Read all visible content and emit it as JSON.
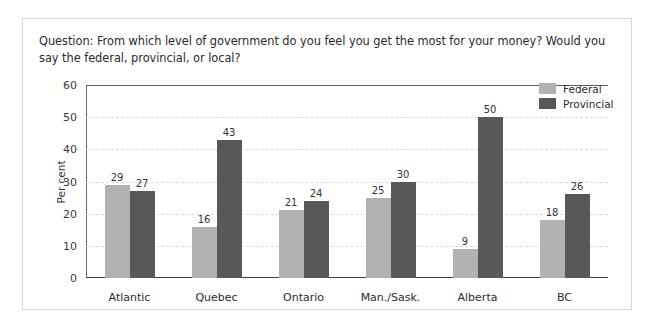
{
  "question": "Question: From which level of government do you feel you get the most for your money? Would you say the federal, provincial, or local?",
  "legend": {
    "federal": "Federal",
    "provincial": "Provincial"
  },
  "colors": {
    "federal": "#b2b2b2",
    "provincial": "#585858",
    "axis": "#3f3f3f",
    "grid": "#d9d9d9",
    "border": "#d6d6d6",
    "text": "#2b2b2b"
  },
  "chart_data": {
    "type": "bar",
    "title": "Question: From which level of government do you feel you get the most for your money? Would you say the federal, provincial, or local?",
    "xlabel": "",
    "ylabel": "Per cent",
    "ylim": [
      0,
      60
    ],
    "yticks": [
      0,
      10,
      20,
      30,
      40,
      50,
      60
    ],
    "ytick_labels": [
      "0",
      "10",
      "20",
      "30",
      "40",
      "50",
      "60"
    ],
    "grid": true,
    "legend_position": "top-right",
    "categories": [
      "Atlantic",
      "Quebec",
      "Ontario",
      "Man./Sask.",
      "Alberta",
      "BC"
    ],
    "series": [
      {
        "name": "Federal",
        "values": [
          29,
          16,
          21,
          25,
          9,
          18
        ]
      },
      {
        "name": "Provincial",
        "values": [
          27,
          43,
          24,
          30,
          50,
          26
        ]
      }
    ]
  }
}
